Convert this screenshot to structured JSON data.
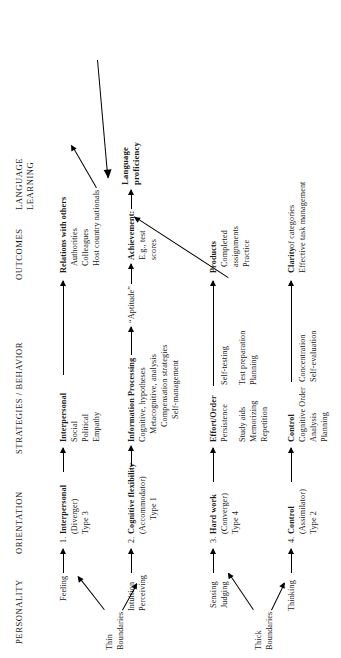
{
  "figure": {
    "title_hidden": "",
    "orientation_note": "rotated-90"
  },
  "columns": [
    {
      "id": "personality",
      "label": "PERSONALITY"
    },
    {
      "id": "orientation",
      "label": "ORIENTATION"
    },
    {
      "id": "strategies",
      "label": "STRATEGIES / BEHAVIOR"
    },
    {
      "id": "outcomes",
      "label": "OUTCOMES"
    },
    {
      "id": "language_learning",
      "label_line1": "LANGUAGE",
      "label_line2": "LEARNING"
    }
  ],
  "rows": [
    {
      "id": "row1",
      "personality": {
        "lines": [
          "Feeling"
        ]
      },
      "orientation": {
        "heading_number": "1.",
        "heading": "Interpersonal",
        "lines": [
          "(Diverger)",
          "Type 3"
        ]
      },
      "strategies": {
        "heading": "Interpersonal",
        "lines": [
          "Social",
          "Political",
          "Empathy"
        ]
      },
      "outcomes": {
        "heading": "Relations with others",
        "lines": [
          "Authorities",
          "Colleagues",
          "Host country nationals"
        ]
      }
    },
    {
      "id": "row2",
      "personality": {
        "lines": [
          "Intuition",
          "Perceiving"
        ]
      },
      "orientation": {
        "heading_number": "2.",
        "heading": "Cognitive flexibility",
        "lines": [
          "(Accommodator)",
          "Type 1"
        ]
      },
      "strategies": {
        "heading": "Information Processing",
        "lines": [
          "Cognitive, hypotheses",
          "Metacognitive, analysis",
          "Compensation strategies",
          "Self-management"
        ]
      },
      "aptitude": "“Aptitude”",
      "outcomes": {
        "heading": "Achievement:",
        "lines": [
          "E.g., test",
          "scores"
        ]
      }
    },
    {
      "id": "row3",
      "personality": {
        "lines": [
          "Sensing",
          "Judging"
        ]
      },
      "orientation": {
        "heading_number": "3.",
        "heading": "Hard work",
        "lines": [
          "(Converger)",
          "Type 4"
        ]
      },
      "strategies": {
        "heading": "Effort/Order",
        "lines": [
          "Persistence",
          "Study aids",
          "Memorizing",
          "Repetition"
        ],
        "lines_right": [
          "Self-testing",
          "Test preparation",
          "Planning"
        ]
      },
      "outcomes": {
        "heading": "Products",
        "lines": [
          "Completed",
          "assignments",
          "Practice"
        ]
      }
    },
    {
      "id": "row4",
      "personality": {
        "lines": [
          "Thinking"
        ]
      },
      "orientation": {
        "heading_number": "4.",
        "heading": "Control",
        "lines": [
          "(Assimilator)",
          "Type 2"
        ]
      },
      "strategies": {
        "heading": "Control",
        "lines": [
          "Cognitive Order",
          "Analysis",
          "Planning"
        ],
        "lines_right": [
          "Concentration",
          "Self-evaluation"
        ]
      },
      "outcomes": {
        "heading": "Clarity",
        "heading_suffix": " of categories",
        "lines": [
          "Effective task management"
        ]
      }
    }
  ],
  "boundaries": [
    {
      "id": "thin",
      "line1": "Thin",
      "line2": "Boundaries"
    },
    {
      "id": "thick",
      "line1": "Thick",
      "line2": "Boundaries"
    }
  ],
  "outcome_final": {
    "line1": "Language",
    "line2": "proficiency"
  },
  "colors": {
    "ink": "#1a1a1a",
    "line": "#000000",
    "background": "#ffffff"
  }
}
